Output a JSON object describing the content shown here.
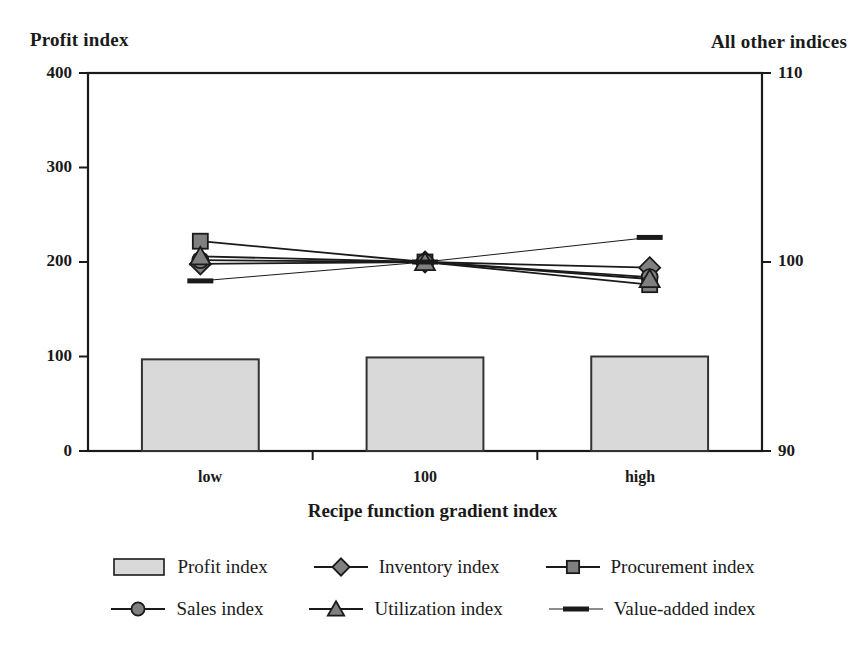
{
  "chart_data": {
    "type": "bar",
    "title": "",
    "xlabel": "Recipe function gradient index",
    "categories": [
      "low",
      "100",
      "high"
    ],
    "grid": false,
    "legend_position": "bottom",
    "axes": {
      "left": {
        "label": "Profit index",
        "ticks": [
          "0",
          "100",
          "200",
          "300",
          "400"
        ],
        "tick_values": [
          0,
          100,
          200,
          300,
          400
        ],
        "ylim": [
          0,
          400
        ]
      },
      "right": {
        "label": "All other indices",
        "ticks": [
          "90",
          "100",
          "110"
        ],
        "tick_values": [
          90,
          100,
          110
        ],
        "ylim": [
          90,
          110
        ]
      }
    },
    "series": [
      {
        "name": "Profit index",
        "type": "bar",
        "axis": "left",
        "marker": "bar-swatch",
        "fill": "#d9d9d9",
        "stroke": "#333333",
        "values": [
          97,
          99,
          100
        ]
      },
      {
        "name": "Inventory index",
        "type": "line",
        "axis": "right",
        "marker": "diamond",
        "fill": "#808080",
        "stroke": "#1a1a1a",
        "values": [
          99.9,
          100,
          99.7
        ]
      },
      {
        "name": "Procurement index",
        "type": "line",
        "axis": "right",
        "marker": "square",
        "fill": "#808080",
        "stroke": "#1a1a1a",
        "values": [
          101.1,
          100,
          98.8
        ]
      },
      {
        "name": "Sales index",
        "type": "line",
        "axis": "right",
        "marker": "circle",
        "fill": "#808080",
        "stroke": "#1a1a1a",
        "values": [
          100.1,
          100,
          99.2
        ]
      },
      {
        "name": "Utilization index",
        "type": "line",
        "axis": "right",
        "marker": "triangle",
        "fill": "#808080",
        "stroke": "#1a1a1a",
        "values": [
          100.3,
          100,
          99.1
        ]
      },
      {
        "name": "Value-added index",
        "type": "line",
        "axis": "right",
        "marker": "dash",
        "fill": "#1a1a1a",
        "stroke": "#1a1a1a",
        "values": [
          99.0,
          100,
          101.3
        ]
      }
    ]
  },
  "legend": {
    "rows": [
      [
        {
          "label": "Profit index",
          "marker": "bar-swatch"
        },
        {
          "label": "Inventory index",
          "marker": "diamond"
        },
        {
          "label": "Procurement index",
          "marker": "square"
        }
      ],
      [
        {
          "label": "Sales index",
          "marker": "circle"
        },
        {
          "label": "Utilization index",
          "marker": "triangle"
        },
        {
          "label": "Value-added index",
          "marker": "dash"
        }
      ]
    ]
  },
  "colors": {
    "bar_fill": "#d9d9d9",
    "marker_fill": "#808080",
    "line": "#1a1a1a",
    "axis": "#1a1a1a",
    "text": "#1a1a1a",
    "background": "#ffffff"
  }
}
